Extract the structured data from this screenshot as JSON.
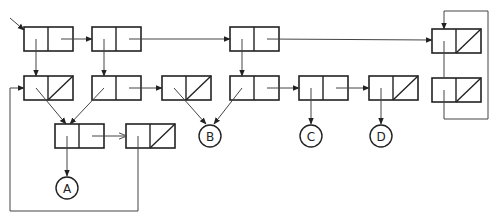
{
  "diagram": {
    "title": "",
    "stroke_color": "#222222",
    "line_color": "#444444",
    "cells": [
      {
        "id": "r1c1",
        "x": 24,
        "y": 27,
        "car": "pointer",
        "cdr": "pointer"
      },
      {
        "id": "r1c2",
        "x": 92,
        "y": 27,
        "car": "pointer",
        "cdr": "pointer"
      },
      {
        "id": "r1c3",
        "x": 230,
        "y": 27,
        "car": "pointer",
        "cdr": "pointer"
      },
      {
        "id": "r1c4",
        "x": 432,
        "y": 29,
        "car": "pointer",
        "cdr": "nil"
      },
      {
        "id": "r2c1",
        "x": 24,
        "y": 76,
        "car": "pointer",
        "cdr": "nil"
      },
      {
        "id": "r2c2",
        "x": 92,
        "y": 76,
        "car": "pointer",
        "cdr": "pointer"
      },
      {
        "id": "r2c3",
        "x": 162,
        "y": 76,
        "car": "pointer",
        "cdr": "nil"
      },
      {
        "id": "r2c4",
        "x": 230,
        "y": 76,
        "car": "pointer",
        "cdr": "pointer"
      },
      {
        "id": "r2c5",
        "x": 299,
        "y": 76,
        "car": "pointer",
        "cdr": "pointer"
      },
      {
        "id": "r2c6",
        "x": 369,
        "y": 76,
        "car": "pointer",
        "cdr": "nil"
      },
      {
        "id": "r2c7",
        "x": 432,
        "y": 78,
        "car": "pointer",
        "cdr": "nil"
      },
      {
        "id": "r3c1",
        "x": 55,
        "y": 124,
        "car": "pointer",
        "cdr": "pointer"
      },
      {
        "id": "r3c2",
        "x": 126,
        "y": 124,
        "car": "pointer",
        "cdr": "nil"
      }
    ],
    "atoms": [
      {
        "id": "atom-a",
        "label": "A",
        "cx": 67,
        "cy": 188
      },
      {
        "id": "atom-b",
        "label": "B",
        "cx": 210,
        "cy": 136
      },
      {
        "id": "atom-c",
        "label": "C",
        "cx": 311,
        "cy": 136
      },
      {
        "id": "atom-d",
        "label": "D",
        "cx": 381,
        "cy": 136
      }
    ]
  }
}
